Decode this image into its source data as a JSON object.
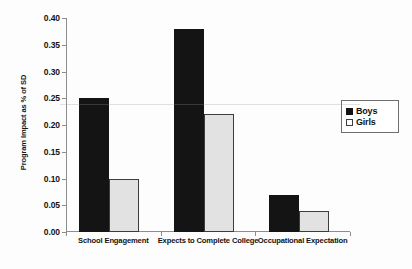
{
  "chart_data": {
    "type": "bar",
    "title": "",
    "xlabel": "",
    "ylabel": "Program Impact as % of SD",
    "categories": [
      "School Engagement",
      "Expects to Complete College",
      "Occupational Expectation"
    ],
    "series": [
      {
        "name": "Boys",
        "color": "#141414",
        "values": [
          0.25,
          0.38,
          0.07
        ]
      },
      {
        "name": "Girls",
        "color": "#e2e2e2",
        "values": [
          0.1,
          0.22,
          0.04
        ]
      }
    ],
    "ylim": [
      0.0,
      0.4
    ],
    "ytick_step": 0.05,
    "ytick_labels": [
      "0.00",
      "0.05",
      "0.10",
      "0.15",
      "0.20",
      "0.25",
      "0.30",
      "0.35",
      "0.40"
    ],
    "grid": false,
    "legend_position": "right"
  },
  "legend": {
    "items": [
      {
        "label": "Boys",
        "swatch": "filled-square-black"
      },
      {
        "label": "Girls",
        "swatch": "open-square-white"
      }
    ]
  }
}
